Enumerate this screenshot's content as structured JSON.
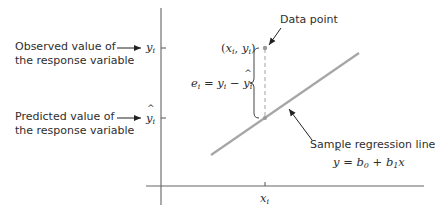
{
  "diagram": {
    "labels": {
      "observed_line1": "Observed value of",
      "observed_line2": "the response variable",
      "predicted_line1": "Predicted value of",
      "predicted_line2": "the response variable",
      "data_point": "Data point",
      "regression_line": "Sample regression line"
    },
    "math": {
      "y_i": "y",
      "y_i_sub": "i",
      "y_hat_i": "y",
      "y_hat_i_sub": "i",
      "point_x": "x",
      "point_x_sub": "i",
      "point_y": "y",
      "point_y_sub": "i",
      "residual_e": "e",
      "residual_e_sub": "i",
      "residual_eq": " = ",
      "residual_y": "y",
      "residual_y_sub": "i",
      "residual_minus": " − ",
      "residual_yhat": "y",
      "residual_yhat_sub": "i",
      "eq_yhat": "y",
      "eq_equals": " = ",
      "eq_b0": "b",
      "eq_b0_sub": "0",
      "eq_plus": " + ",
      "eq_b1": "b",
      "eq_b1_sub": "1",
      "eq_x": "x",
      "x_tick": "x",
      "x_tick_sub": "i"
    },
    "colors": {
      "axis": "#444444",
      "regression_line": "#a6a6a6",
      "dashed": "#b8b8b8",
      "text": "#2e2e2e"
    }
  }
}
